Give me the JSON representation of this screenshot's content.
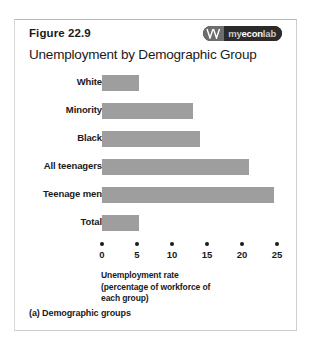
{
  "figure": {
    "number_label": "Figure 22.9",
    "title": "Unemployment by Demographic Group",
    "panel_caption": "(a) Demographic groups"
  },
  "brand": {
    "name": "myeconlab",
    "part_my": "my",
    "part_econ": "econ",
    "part_lab": "lab",
    "mark_icon": "double-chevron-mark-icon"
  },
  "axis_caption": {
    "line1": "Unemployment rate",
    "line2": "(percentage of workforce of",
    "line3": "each group)"
  },
  "colors": {
    "bar_fill": "#9e9e9e",
    "text": "#1a1a1a",
    "card_border": "#cfcfcf",
    "brand_bg": "#2b2b2b",
    "brand_mark_bg": "#6d6d6d"
  },
  "chart_data": {
    "type": "bar",
    "orientation": "horizontal",
    "title": "Unemployment by Demographic Group",
    "xlabel": "Unemployment rate (percentage of workforce of each group)",
    "ylabel": "",
    "categories": [
      "White",
      "Minority",
      "Black",
      "All teenagers",
      "Teenage men",
      "Total"
    ],
    "values": [
      5.3,
      13.0,
      14.0,
      21.0,
      24.5,
      5.3
    ],
    "xlim": [
      0,
      25
    ],
    "xticks": [
      0,
      5,
      10,
      15,
      20,
      25
    ],
    "xticklabels": [
      "0",
      "5",
      "10",
      "15",
      "20",
      "25"
    ],
    "grid": false,
    "legend": false,
    "series": [
      {
        "name": "Unemployment rate",
        "values": [
          5.3,
          13.0,
          14.0,
          21.0,
          24.5,
          5.3
        ]
      }
    ]
  }
}
